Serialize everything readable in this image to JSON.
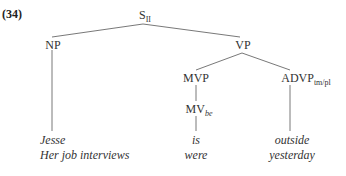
{
  "example_number": "(34)",
  "tree": {
    "root": {
      "label": "S",
      "subscript": "II"
    },
    "np": {
      "label": "NP"
    },
    "vp": {
      "label": "VP"
    },
    "mvp": {
      "label": "MVP"
    },
    "mv": {
      "label": "MV",
      "subscript": "be"
    },
    "advp": {
      "label": "ADVP",
      "subscript": "tm/pl"
    }
  },
  "leaves": {
    "np": [
      "Jesse",
      "Her job interviews"
    ],
    "mv": [
      "is",
      "were"
    ],
    "advp": [
      "outside",
      "yesterday"
    ]
  }
}
